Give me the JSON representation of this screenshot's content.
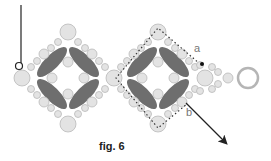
{
  "figure": {
    "caption": "fig. 6",
    "labels": {
      "a": "a",
      "b": "b"
    }
  },
  "colors": {
    "bead_fill": "#e3e3e3",
    "bead_stroke": "#b9b9b9",
    "petal": "#6e6e6e",
    "thread": "#222222",
    "ring": "#b5b5b5"
  },
  "diagram": {
    "units": [
      {
        "name": "left-diamond",
        "center": [
          68,
          78
        ]
      },
      {
        "name": "right-diamond",
        "center": [
          158,
          78
        ],
        "thread_path": "dotted"
      }
    ],
    "end_ring": {
      "center": [
        248,
        78
      ],
      "r": 10
    },
    "arrow": {
      "from": [
        186,
        103
      ],
      "to": [
        228,
        145
      ]
    },
    "thread_start": {
      "from": [
        21,
        5
      ],
      "to": [
        21,
        64
      ]
    }
  }
}
